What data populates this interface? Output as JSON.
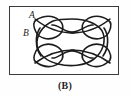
{
  "figure": {
    "caption": "(B)",
    "frame": {
      "border_color": "#3a3a3a",
      "fill_color": "#ffffff",
      "x": 9,
      "y": 6,
      "width": 110,
      "height": 69
    },
    "background_color": "#fefefe",
    "curve": {
      "name": "self-intersecting-closed-curve",
      "stroke_color": "#1c1c1c",
      "stroke_width": 1.6,
      "description": "Closed curve with four corner loops and top/bottom inward dips",
      "loop_count": 4,
      "crossing_count": 8
    },
    "labels": [
      {
        "id": "A",
        "text": "A",
        "x": 29,
        "y": 11,
        "style": "italic-serif"
      },
      {
        "id": "B",
        "text": "B",
        "x": 23,
        "y": 29,
        "style": "italic-serif"
      }
    ]
  }
}
